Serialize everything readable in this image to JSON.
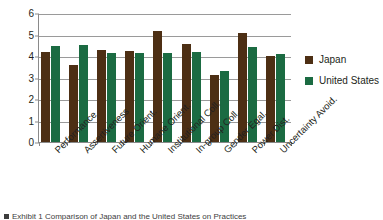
{
  "chart_data": {
    "type": "bar",
    "title": "",
    "xlabel": "",
    "ylabel": "",
    "ylim": [
      0,
      6
    ],
    "yticks": [
      0,
      1,
      2,
      3,
      4,
      5,
      6
    ],
    "ytick_labels": [
      "0",
      "1",
      "2",
      "3",
      "4",
      "5",
      "6"
    ],
    "grid": true,
    "legend_position": "right",
    "categories": [
      "Performance",
      "Assertiveness",
      "Future Orient.",
      "Humane Orient.",
      "Institutional Coll.",
      "In-group Coll.",
      "Gender Egal.",
      "Power Dist.",
      "Uncertainty Avoid."
    ],
    "series": [
      {
        "name": "Japan",
        "color": "#4d2f14",
        "values": [
          4.18,
          3.56,
          4.27,
          4.25,
          5.16,
          4.57,
          3.12,
          5.05,
          3.98
        ]
      },
      {
        "name": "United States",
        "color": "#1b6b42",
        "values": [
          4.47,
          4.51,
          4.12,
          4.16,
          4.12,
          4.21,
          3.3,
          4.44,
          4.1
        ]
      }
    ]
  },
  "legend": {
    "items": [
      {
        "label": "Japan",
        "color": "#4d2f14"
      },
      {
        "label": "United States",
        "color": "#1b6b42"
      }
    ]
  },
  "caption": {
    "text": "Exhibit 1 Comparison of Japan and the United States on Practices"
  }
}
